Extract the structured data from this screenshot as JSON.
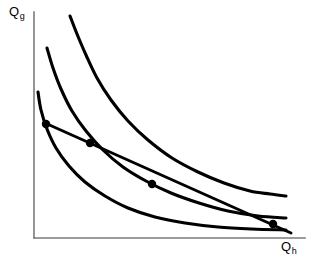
{
  "figure": {
    "background_color": "#ffffff",
    "curve_color": "#000000",
    "axis_color": "#7a7a7a",
    "marker_color": "#000000"
  },
  "axes": {
    "y_label_base": "Q",
    "y_label_sub": "g",
    "x_label_base": "Q",
    "x_label_sub": "h",
    "origin_x": 34,
    "origin_y": 238,
    "y_axis_top": 12,
    "x_axis_right": 305
  },
  "chart_data": {
    "type": "line",
    "title": "",
    "xlabel": "Q_h",
    "ylabel": "Q_g",
    "grid": false,
    "legend": "none",
    "xlim": [
      34,
      305
    ],
    "ylim": [
      238,
      12
    ],
    "note": "Coordinates are in screenshot pixel space: x increases right, y increases downward.",
    "series": [
      {
        "name": "indifference-curve-outer",
        "kind": "curve",
        "points": [
          [
            70,
            16
          ],
          [
            77,
            34
          ],
          [
            86,
            55
          ],
          [
            97,
            78
          ],
          [
            111,
            100
          ],
          [
            128,
            121
          ],
          [
            148,
            140
          ],
          [
            172,
            158
          ],
          [
            198,
            172
          ],
          [
            224,
            183
          ],
          [
            250,
            191
          ],
          [
            270,
            194
          ],
          [
            286,
            196
          ]
        ]
      },
      {
        "name": "indifference-curve-middle",
        "kind": "curve",
        "points": [
          [
            47,
            48
          ],
          [
            53,
            68
          ],
          [
            61,
            89
          ],
          [
            72,
            111
          ],
          [
            86,
            131
          ],
          [
            103,
            150
          ],
          [
            123,
            167
          ],
          [
            146,
            181
          ],
          [
            171,
            193
          ],
          [
            199,
            203
          ],
          [
            228,
            211
          ],
          [
            258,
            216
          ],
          [
            286,
            218
          ]
        ]
      },
      {
        "name": "indifference-curve-inner",
        "kind": "curve",
        "points": [
          [
            38,
            92
          ],
          [
            41,
            110
          ],
          [
            47,
            129
          ],
          [
            56,
            148
          ],
          [
            69,
            166
          ],
          [
            85,
            182
          ],
          [
            105,
            196
          ],
          [
            128,
            208
          ],
          [
            155,
            217
          ],
          [
            185,
            223
          ],
          [
            218,
            227
          ],
          [
            252,
            229
          ],
          [
            286,
            230
          ]
        ]
      },
      {
        "name": "budget-line",
        "kind": "line",
        "points": [
          [
            45,
            123
          ],
          [
            291,
            233
          ]
        ]
      }
    ],
    "points": [
      {
        "name": "point-a",
        "x": 46,
        "y": 124,
        "label": "",
        "description": "budget line endpoint on outer region near Q_g axis"
      },
      {
        "name": "point-b",
        "x": 90,
        "y": 143,
        "label": "",
        "description": "intersection of budget line with middle indifference curve"
      },
      {
        "name": "point-c",
        "x": 152,
        "y": 184,
        "label": "",
        "description": "tangency of budget line with middle indifference curve"
      },
      {
        "name": "point-d",
        "x": 273,
        "y": 224,
        "label": "",
        "description": "intersection of budget line with inner indifference curve"
      }
    ]
  }
}
